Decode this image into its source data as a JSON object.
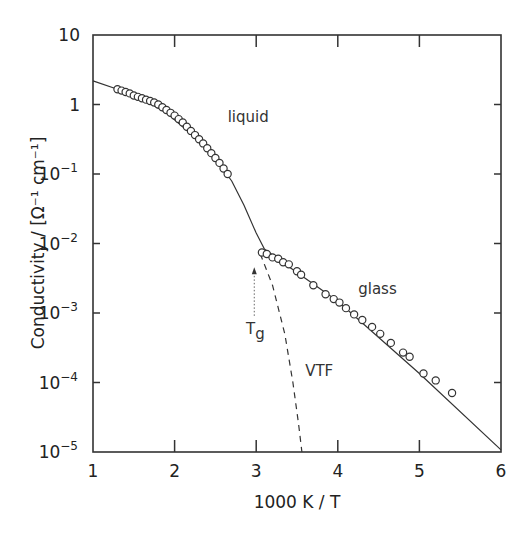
{
  "chart_data": {
    "type": "line",
    "title": "",
    "xlabel": "1000 K / T",
    "ylabel": "Conductivity / [Ω⁻¹ cm⁻¹]",
    "xlim": [
      1,
      6
    ],
    "ylim": [
      1e-05,
      10
    ],
    "yscale": "log",
    "grid": false,
    "legend": null,
    "x_ticks": [
      "1",
      "2",
      "3",
      "4",
      "5",
      "6"
    ],
    "y_ticks": [
      {
        "base": "10",
        "exp": "",
        "value": 10
      },
      {
        "base": "1",
        "exp": "",
        "value": 1
      },
      {
        "base": "10",
        "exp": "-1",
        "value": 0.1
      },
      {
        "base": "10",
        "exp": "-2",
        "value": 0.01
      },
      {
        "base": "10",
        "exp": "-3",
        "value": 0.001
      },
      {
        "base": "10",
        "exp": "-4",
        "value": 0.0001
      },
      {
        "base": "10",
        "exp": "-5",
        "value": 1e-05
      }
    ],
    "series": [
      {
        "name": "fit (solid)",
        "style": "solid",
        "points_log10": [
          [
            1.0,
            0.34
          ],
          [
            1.3,
            0.22
          ],
          [
            1.6,
            0.08
          ],
          [
            1.9,
            -0.12
          ],
          [
            2.2,
            -0.42
          ],
          [
            2.5,
            -0.78
          ],
          [
            2.7,
            -1.1
          ],
          [
            2.85,
            -1.45
          ],
          [
            3.0,
            -1.85
          ],
          [
            3.1,
            -2.08
          ],
          [
            3.3,
            -2.25
          ],
          [
            4.0,
            -2.83
          ],
          [
            5.0,
            -3.87
          ],
          [
            6.0,
            -4.97
          ]
        ]
      },
      {
        "name": "VTF",
        "style": "dashed",
        "points_log10": [
          [
            3.05,
            -2.15
          ],
          [
            3.2,
            -2.6
          ],
          [
            3.35,
            -3.3
          ],
          [
            3.45,
            -4.0
          ],
          [
            3.52,
            -4.6
          ],
          [
            3.56,
            -5.0
          ]
        ]
      },
      {
        "name": "liquid (data)",
        "style": "markers",
        "points_log10": [
          [
            1.3,
            0.22
          ],
          [
            1.35,
            0.2
          ],
          [
            1.4,
            0.18
          ],
          [
            1.45,
            0.16
          ],
          [
            1.5,
            0.13
          ],
          [
            1.55,
            0.11
          ],
          [
            1.6,
            0.09
          ],
          [
            1.65,
            0.07
          ],
          [
            1.7,
            0.05
          ],
          [
            1.75,
            0.03
          ],
          [
            1.8,
            0.0
          ],
          [
            1.85,
            -0.04
          ],
          [
            1.9,
            -0.08
          ],
          [
            1.95,
            -0.12
          ],
          [
            2.0,
            -0.16
          ],
          [
            2.05,
            -0.21
          ],
          [
            2.1,
            -0.26
          ],
          [
            2.15,
            -0.32
          ],
          [
            2.2,
            -0.38
          ],
          [
            2.25,
            -0.44
          ],
          [
            2.3,
            -0.5
          ],
          [
            2.35,
            -0.56
          ],
          [
            2.4,
            -0.63
          ],
          [
            2.45,
            -0.7
          ],
          [
            2.5,
            -0.77
          ],
          [
            2.55,
            -0.84
          ],
          [
            2.6,
            -0.92
          ],
          [
            2.65,
            -1.0
          ]
        ]
      },
      {
        "name": "glass (data)",
        "style": "markers",
        "points_log10": [
          [
            3.07,
            -2.13
          ],
          [
            3.13,
            -2.15
          ],
          [
            3.2,
            -2.2
          ],
          [
            3.27,
            -2.22
          ],
          [
            3.33,
            -2.27
          ],
          [
            3.4,
            -2.3
          ],
          [
            3.5,
            -2.4
          ],
          [
            3.55,
            -2.45
          ],
          [
            3.7,
            -2.6
          ],
          [
            3.85,
            -2.73
          ],
          [
            3.95,
            -2.8
          ],
          [
            4.02,
            -2.85
          ],
          [
            4.1,
            -2.93
          ],
          [
            4.2,
            -3.02
          ],
          [
            4.3,
            -3.1
          ],
          [
            4.42,
            -3.2
          ],
          [
            4.52,
            -3.3
          ],
          [
            4.65,
            -3.43
          ],
          [
            4.8,
            -3.57
          ],
          [
            4.88,
            -3.63
          ],
          [
            5.05,
            -3.87
          ],
          [
            5.2,
            -3.97
          ],
          [
            5.4,
            -4.15
          ]
        ]
      }
    ],
    "annotations": [
      {
        "text": "liquid",
        "x": 2.65,
        "y_log10": -0.25
      },
      {
        "text": "glass",
        "x": 4.25,
        "y_log10": -2.72
      },
      {
        "text": "VTF",
        "x": 3.6,
        "y_log10": -3.9
      },
      {
        "text": "Tg",
        "x": 2.95,
        "y_log10": -3.3,
        "arrow_to": {
          "x": 3.05,
          "y_log10": -2.3
        }
      }
    ]
  }
}
